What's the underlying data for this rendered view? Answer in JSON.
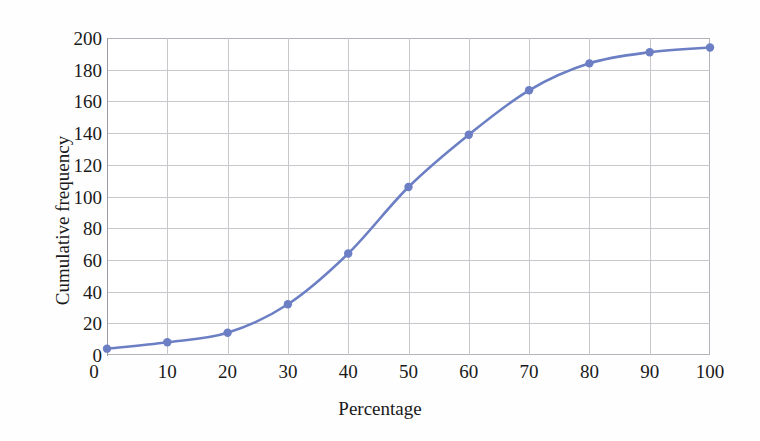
{
  "chart_data": {
    "type": "line",
    "title": "",
    "xlabel": "Percentage",
    "ylabel": "Cumulative frequency",
    "xlim": [
      0,
      100
    ],
    "ylim": [
      0,
      200
    ],
    "xticks": [
      0,
      10,
      20,
      30,
      40,
      50,
      60,
      70,
      80,
      90,
      100
    ],
    "xtick_labels": [
      "0",
      "10",
      "20",
      "30",
      "40",
      "50",
      "60",
      "70",
      "80",
      "90",
      "100"
    ],
    "yticks": [
      0,
      20,
      40,
      60,
      80,
      100,
      120,
      140,
      160,
      180,
      200
    ],
    "ytick_labels": [
      "0",
      "20",
      "40",
      "60",
      "80",
      "100",
      "120",
      "140",
      "160",
      "180",
      "200"
    ],
    "grid": true,
    "grid_x": true,
    "grid_y": true,
    "legend": false,
    "legend_position": "none",
    "markers": "circle",
    "smooth": true,
    "x": [
      0,
      10,
      20,
      30,
      40,
      50,
      60,
      70,
      80,
      90,
      100
    ],
    "series": [
      {
        "name": "Cumulative frequency",
        "color": "#6C7FC4",
        "values": [
          4,
          8,
          14,
          32,
          64,
          106,
          139,
          167,
          184,
          191,
          194
        ]
      }
    ]
  },
  "colors": {
    "line": "#6C7FC4",
    "marker": "#6C7FC4",
    "grid": "#c8c8cc",
    "frame": "#b2b2b8",
    "text": "#1a1a1a",
    "background": "#fefefe"
  }
}
